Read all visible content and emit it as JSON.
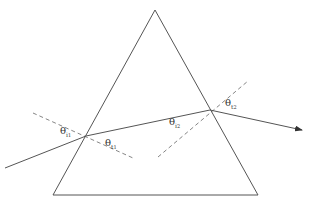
{
  "diagram": {
    "type": "prism-refraction",
    "colors": {
      "stroke": "#555555",
      "dashed": "#666666",
      "label": "#333333"
    },
    "prism": {
      "apex": [
        155,
        10
      ],
      "bottom_left": [
        53,
        195
      ],
      "bottom_right": [
        258,
        195
      ]
    },
    "rays": {
      "incident": {
        "from": [
          5,
          168
        ],
        "to": [
          86,
          136
        ]
      },
      "internal": {
        "from": [
          86,
          136
        ],
        "to": [
          210,
          110
        ]
      },
      "emergent": {
        "from": [
          210,
          110
        ],
        "to": [
          302,
          130
        ],
        "arrow": true
      }
    },
    "normals": [
      {
        "name": "normal-1",
        "from": [
          33,
          113
        ],
        "to": [
          133,
          158
        ]
      },
      {
        "name": "normal-2",
        "from": [
          158,
          157
        ],
        "to": [
          248,
          81
        ]
      }
    ],
    "labels": {
      "theta_i1": {
        "symbol": "θ",
        "sub": "i",
        "subsub": "1",
        "pos": [
          60,
          126
        ]
      },
      "theta_t1": {
        "symbol": "θ",
        "sub": "t",
        "subsub": "1",
        "pos": [
          105,
          138
        ]
      },
      "theta_i2": {
        "symbol": "θ",
        "sub": "i",
        "subsub": "2",
        "pos": [
          169,
          117
        ]
      },
      "theta_t2": {
        "symbol": "θ",
        "sub": "t",
        "subsub": "2",
        "pos": [
          225,
          98
        ]
      }
    }
  }
}
